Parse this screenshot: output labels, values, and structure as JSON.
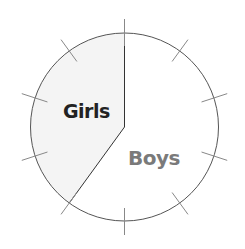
{
  "chart_data": {
    "type": "pie",
    "title": "",
    "categories": [
      "Girls",
      "Boys"
    ],
    "values": [
      40,
      60
    ],
    "unit": "percent",
    "slices": [
      {
        "label": "Girls",
        "value": 40,
        "fill": "#f4f4f4",
        "label_color": "#222222",
        "start_deg": 216,
        "end_deg": 360
      },
      {
        "label": "Boys",
        "value": 60,
        "fill": "#ffffff",
        "label_color": "#7a7a7a",
        "start_deg": 0,
        "end_deg": 216
      }
    ],
    "tick_marks": {
      "count": 10,
      "interval_deg": 36
    },
    "legend": "none",
    "grid": false
  },
  "labels": {
    "girls": "Girls",
    "boys": "Boys"
  },
  "colors": {
    "outline": "#555555",
    "ticks": "#888888",
    "girls_fill": "#f4f4f4"
  }
}
